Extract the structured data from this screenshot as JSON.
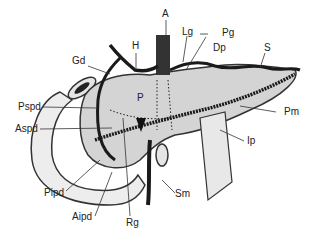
{
  "diagram": {
    "labels": {
      "A": "A",
      "Lg": "Lg",
      "Pg": "Pg",
      "Dp": "Dp",
      "H": "H",
      "Gd": "Gd",
      "S": "S",
      "Pspd": "Pspd",
      "P": "P",
      "Pm": "Pm",
      "Aspd": "Aspd",
      "Ip": "Ip",
      "Pipd": "Pipd",
      "Aipd": "Aipd",
      "Rg": "Rg",
      "Sm": "Sm"
    },
    "colors": {
      "organ_fill": "#d4d4d4",
      "duodenum_fill": "#ededed",
      "vessel": "#1a1a1a",
      "outline": "#333333"
    }
  }
}
